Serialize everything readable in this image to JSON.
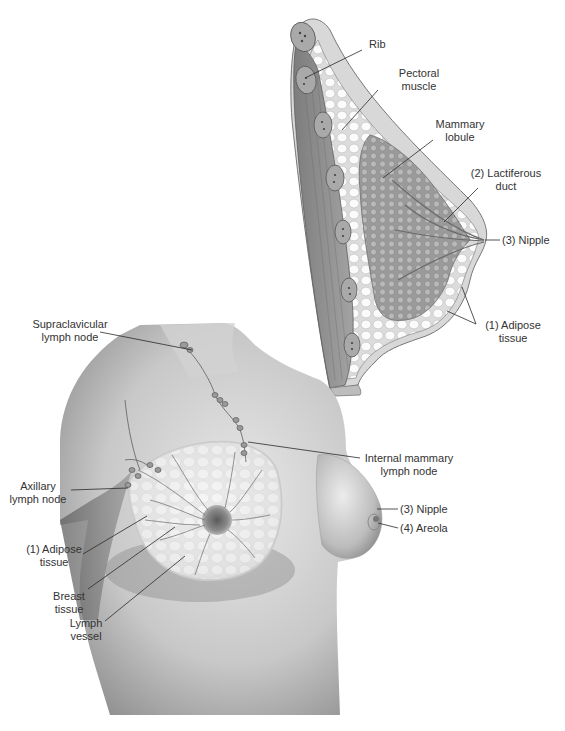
{
  "diagram": {
    "colors": {
      "background": "#ffffff",
      "label_text": "#333333",
      "leader_line": "#2a2a2a",
      "skin_light": "#e6e6e6",
      "skin_mid": "#bdbdbd",
      "skin_dark": "#7a7a7a",
      "muscle": "#8a8a8a",
      "fat_lobule": "#f2f2f2",
      "gland": "#9c9c9c"
    },
    "cross_section": {
      "name": "sagittal-cross-section",
      "labels": [
        {
          "id": "rib",
          "lines": [
            "Rib"
          ]
        },
        {
          "id": "pectoral-muscle",
          "lines": [
            "Pectoral",
            "muscle"
          ]
        },
        {
          "id": "mammary-lobule",
          "lines": [
            "Mammary",
            "lobule"
          ]
        },
        {
          "id": "lactiferous-duct",
          "lines": [
            "(2) Lactiferous",
            "duct"
          ]
        },
        {
          "id": "nipple-section",
          "lines": [
            "(3) Nipple"
          ]
        },
        {
          "id": "adipose-section",
          "lines": [
            "(1) Adipose",
            "tissue"
          ]
        }
      ]
    },
    "torso_view": {
      "name": "frontal-torso-view",
      "labels": [
        {
          "id": "supraclavicular-lymph-node",
          "lines": [
            "Supraclavicular",
            "lymph node"
          ]
        },
        {
          "id": "internal-mammary-lymph-node",
          "lines": [
            "Internal mammary",
            "lymph node"
          ]
        },
        {
          "id": "axillary-lymph-node",
          "lines": [
            "Axillary",
            "lymph node"
          ]
        },
        {
          "id": "nipple-torso",
          "lines": [
            "(3) Nipple"
          ]
        },
        {
          "id": "areola",
          "lines": [
            "(4) Areola"
          ]
        },
        {
          "id": "adipose-torso",
          "lines": [
            "(1) Adipose",
            "tissue"
          ]
        },
        {
          "id": "breast-tissue",
          "lines": [
            "Breast",
            "tissue"
          ]
        },
        {
          "id": "lymph-vessel",
          "lines": [
            "Lymph",
            "vessel"
          ]
        }
      ]
    }
  }
}
